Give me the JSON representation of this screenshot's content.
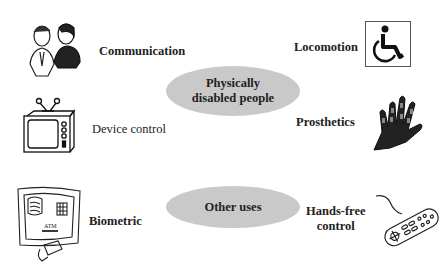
{
  "diagram": {
    "center_nodes": [
      {
        "id": "physically-disabled",
        "label": "Physically disabled people",
        "line1": "Physically",
        "line2": "disabled people",
        "fill": "#c9c9c9"
      },
      {
        "id": "other-uses",
        "label": "Other uses",
        "fill": "#c9c9c9"
      }
    ],
    "items": [
      {
        "label": "Communication",
        "icon": "two-people-talking-icon",
        "group": "physically-disabled"
      },
      {
        "label": "Locomotion",
        "icon": "wheelchair-icon",
        "group": "physically-disabled"
      },
      {
        "label": "Device control",
        "icon": "television-icon",
        "group": "physically-disabled"
      },
      {
        "label": "Prosthetics",
        "icon": "robotic-hand-icon",
        "group": "physically-disabled"
      },
      {
        "label": "Biometric",
        "icon": "atm-machine-icon",
        "group": "other-uses"
      },
      {
        "label": "Hands-free control",
        "line1": "Hands-free",
        "line2": "control",
        "icon": "remote-control-icon",
        "group": "other-uses"
      }
    ]
  }
}
